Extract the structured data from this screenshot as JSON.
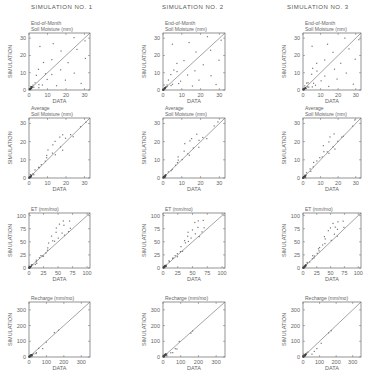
{
  "columns": [
    {
      "title": "SIMULATION  NO. 1",
      "x": 29,
      "w": 61,
      "tx": 31
    },
    {
      "title": "SIMULATION  NO. 2",
      "x": 163,
      "w": 62,
      "tx": 165
    },
    {
      "title": "SIMULATION  NO. 3",
      "x": 303,
      "w": 58,
      "tx": 287
    }
  ],
  "rows": [
    {
      "label_lines": [
        "End-of-Month",
        "Soil Moisture  (mm)"
      ],
      "y": 33,
      "h": 57,
      "max": 33,
      "ticks": [
        0,
        10,
        20,
        30
      ],
      "tick_labels": [
        "0",
        "10",
        "20",
        "30"
      ]
    },
    {
      "label_lines": [
        "Average",
        "Soil Moisture  (mm)"
      ],
      "y": 118,
      "h": 60,
      "max": 33,
      "ticks": [
        0,
        10,
        20,
        30
      ],
      "tick_labels": [
        "0",
        "10",
        "20",
        "30"
      ]
    },
    {
      "label_lines": [
        "ET  (mm/mo)"
      ],
      "y": 213,
      "h": 55,
      "max": 105,
      "ticks": [
        0,
        25,
        50,
        75,
        100
      ],
      "tick_labels": [
        "0",
        "25",
        "50",
        "75",
        "100"
      ]
    },
    {
      "label_lines": [
        "Recharge  (mm/mo)"
      ],
      "y": 302,
      "h": 55,
      "max": 350,
      "ticks": [
        0,
        100,
        200,
        300
      ],
      "tick_labels": [
        "0",
        "100",
        "200",
        "300"
      ]
    }
  ],
  "axis_labels": {
    "x": "DATA",
    "y": "SIMULATION"
  },
  "chart_data": {
    "type": "scatter",
    "layout": "4 rows x 3 columns grid of simulated vs observed scatter plots with 1:1 line",
    "column_titles": [
      "SIMULATION NO. 1",
      "SIMULATION NO. 2",
      "SIMULATION NO. 3"
    ],
    "row_variables": [
      "End-of-Month Soil Moisture (mm)",
      "Average Soil Moisture (mm)",
      "ET (mm/mo)",
      "Recharge (mm/mo)"
    ],
    "xlabel": "DATA",
    "ylabel": "SIMULATION",
    "reference_line": "1:1",
    "panels": [
      {
        "row": 0,
        "xlim": [
          0,
          33
        ],
        "ylim": [
          0,
          33
        ],
        "ticks": [
          0,
          10,
          20,
          30
        ],
        "pattern": "wide scatter, clustered near origin"
      },
      {
        "row": 1,
        "xlim": [
          0,
          33
        ],
        "ylim": [
          0,
          33
        ],
        "ticks": [
          0,
          10,
          20,
          30
        ],
        "pattern": "close to 1:1, some overestimation at 10-20"
      },
      {
        "row": 2,
        "xlim": [
          0,
          105
        ],
        "ylim": [
          0,
          105
        ],
        "ticks": [
          0,
          25,
          50,
          75,
          100
        ],
        "pattern": "close to 1:1 at low values, overestimation 40-80"
      },
      {
        "row": 3,
        "xlim": [
          0,
          350
        ],
        "ylim": [
          0,
          350
        ],
        "ticks": [
          0,
          100,
          200,
          300
        ],
        "pattern": "most points near origin, few up to ~150"
      }
    ],
    "series": [
      {
        "name": "End-of-Month Soil Moisture",
        "points": [
          [
            0,
            0
          ],
          [
            1,
            1
          ],
          [
            1,
            2
          ],
          [
            2,
            1
          ],
          [
            2,
            3
          ],
          [
            3,
            1
          ],
          [
            3,
            5
          ],
          [
            4,
            9
          ],
          [
            5,
            2
          ],
          [
            5,
            12
          ],
          [
            6,
            4
          ],
          [
            7,
            15
          ],
          [
            8,
            3
          ],
          [
            8,
            10
          ],
          [
            10,
            6
          ],
          [
            12,
            18
          ],
          [
            13,
            8
          ],
          [
            15,
            3
          ],
          [
            17,
            12
          ],
          [
            18,
            22
          ],
          [
            20,
            6
          ],
          [
            22,
            15
          ],
          [
            25,
            9
          ],
          [
            26,
            24
          ],
          [
            28,
            4
          ],
          [
            30,
            18
          ],
          [
            31,
            29
          ],
          [
            6,
            26
          ],
          [
            14,
            27
          ],
          [
            24,
            30
          ]
        ]
      },
      {
        "name": "Average Soil Moisture",
        "points": [
          [
            0,
            0
          ],
          [
            1,
            1
          ],
          [
            2,
            2
          ],
          [
            3,
            3
          ],
          [
            4,
            4
          ],
          [
            5,
            5
          ],
          [
            6,
            6
          ],
          [
            7,
            8
          ],
          [
            8,
            9
          ],
          [
            9,
            12
          ],
          [
            10,
            11
          ],
          [
            11,
            15
          ],
          [
            12,
            18
          ],
          [
            13,
            14
          ],
          [
            14,
            20
          ],
          [
            15,
            13
          ],
          [
            16,
            22
          ],
          [
            17,
            17
          ],
          [
            18,
            24
          ],
          [
            19,
            16
          ],
          [
            20,
            21
          ],
          [
            22,
            23
          ],
          [
            24,
            22
          ],
          [
            28,
            29
          ],
          [
            30,
            31
          ]
        ]
      },
      {
        "name": "ET",
        "points": [
          [
            0,
            0
          ],
          [
            3,
            3
          ],
          [
            5,
            5
          ],
          [
            8,
            8
          ],
          [
            10,
            11
          ],
          [
            12,
            12
          ],
          [
            15,
            16
          ],
          [
            18,
            18
          ],
          [
            20,
            22
          ],
          [
            22,
            20
          ],
          [
            25,
            25
          ],
          [
            28,
            30
          ],
          [
            30,
            35
          ],
          [
            33,
            40
          ],
          [
            35,
            45
          ],
          [
            38,
            55
          ],
          [
            40,
            62
          ],
          [
            42,
            48
          ],
          [
            45,
            70
          ],
          [
            48,
            75
          ],
          [
            50,
            55
          ],
          [
            52,
            85
          ],
          [
            55,
            65
          ],
          [
            58,
            80
          ],
          [
            60,
            62
          ],
          [
            62,
            88
          ],
          [
            65,
            72
          ],
          [
            70,
            90
          ],
          [
            72,
            78
          ]
        ]
      },
      {
        "name": "Recharge",
        "points": [
          [
            0,
            0
          ],
          [
            2,
            1
          ],
          [
            5,
            3
          ],
          [
            8,
            2
          ],
          [
            10,
            8
          ],
          [
            15,
            5
          ],
          [
            20,
            14
          ],
          [
            30,
            25
          ],
          [
            40,
            35
          ],
          [
            50,
            28
          ],
          [
            60,
            45
          ],
          [
            80,
            60
          ],
          [
            100,
            90
          ],
          [
            150,
            145
          ],
          [
            170,
            160
          ]
        ]
      }
    ]
  }
}
